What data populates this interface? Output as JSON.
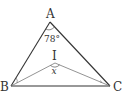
{
  "figure": {
    "type": "triangle-incenter",
    "vertices": {
      "A": "A",
      "B": "B",
      "C": "C"
    },
    "incenter_label": "I",
    "angle_A_label": "78°",
    "angle_BIC_label": "x",
    "colors": {
      "triangle": "#333333",
      "bisectors": "#777777",
      "text": "#333333"
    }
  }
}
